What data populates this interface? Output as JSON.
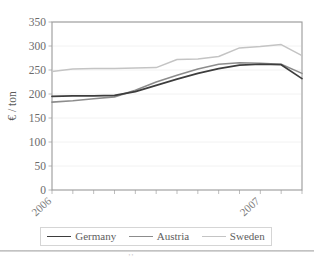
{
  "chart_data": {
    "type": "line",
    "title": "",
    "xlabel": "",
    "ylabel": "€ / ton",
    "ylim": [
      0,
      350
    ],
    "ytick_step": 50,
    "yticks": [
      "0",
      "50",
      "100",
      "150",
      "200",
      "250",
      "300",
      "350"
    ],
    "xticks": [
      "2006",
      "2007"
    ],
    "xtick_positions": [
      0,
      10
    ],
    "grid": "horizontal",
    "legend_position": "bottom",
    "n_points": 13,
    "x": [
      0,
      1,
      2,
      3,
      4,
      5,
      6,
      7,
      8,
      9,
      10,
      11,
      12
    ],
    "series": [
      {
        "name": "Germany",
        "color": "#3d3d3d",
        "width": 1.7,
        "values": [
          195,
          196,
          196,
          197,
          205,
          218,
          231,
          243,
          253,
          260,
          262,
          261,
          232
        ]
      },
      {
        "name": "Austria",
        "color": "#8c8c8c",
        "width": 1.6,
        "values": [
          183,
          186,
          190,
          194,
          208,
          225,
          239,
          252,
          262,
          265,
          264,
          262,
          243
        ]
      },
      {
        "name": "Sweden",
        "color": "#c4c4c4",
        "width": 1.5,
        "values": [
          247,
          252,
          253,
          253,
          254,
          255,
          272,
          273,
          278,
          296,
          299,
          303,
          280
        ]
      }
    ]
  },
  "legend": {
    "items": [
      {
        "label": "Germany",
        "color": "#3d3d3d"
      },
      {
        "label": "Austria",
        "color": "#8c8c8c"
      },
      {
        "label": "Sweden",
        "color": "#c4c4c4"
      }
    ]
  },
  "footer": {
    "mark": "’’"
  }
}
